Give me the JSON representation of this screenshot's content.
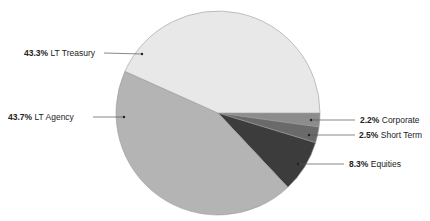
{
  "chart_data": {
    "type": "pie",
    "title": "",
    "categories": [
      "Corporate",
      "Short Term",
      "Equities",
      "LT Agency",
      "LT Treasury"
    ],
    "values": [
      2.2,
      2.5,
      8.3,
      43.7,
      43.3
    ],
    "labels": [
      "2.2%",
      "2.5%",
      "8.3%",
      "43.7%",
      "43.3%"
    ],
    "colors": [
      "#8c8c8c",
      "#6a6a6a",
      "#3c3c3c",
      "#b4b4b4",
      "#e8e8e8"
    ],
    "start_angle_deg": 0,
    "direction": "clockwise",
    "legend": "none (leader-line labels)"
  },
  "labels": {
    "lt_treasury": {
      "pct": "43.3%",
      "name": "LT Treasury"
    },
    "lt_agency": {
      "pct": "43.7%",
      "name": "LT Agency"
    },
    "corporate": {
      "pct": "2.2%",
      "name": "Corporate"
    },
    "short_term": {
      "pct": "2.5%",
      "name": "Short Term"
    },
    "equities": {
      "pct": "8.3%",
      "name": "Equities"
    }
  }
}
